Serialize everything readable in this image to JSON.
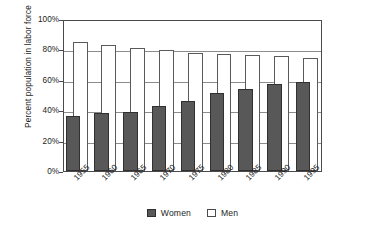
{
  "chart_data": {
    "type": "bar",
    "title": "",
    "subtitle": "",
    "xlabel": "",
    "ylabel": "Percent population in labor force",
    "ylim": [
      0,
      100
    ],
    "yticks": [
      "0%",
      "20%",
      "40%",
      "60%",
      "80%",
      "100%"
    ],
    "ytick_values": [
      0,
      20,
      40,
      60,
      80,
      100
    ],
    "grid": true,
    "legend_position": "bottom-center",
    "bar_style": "overlapped",
    "categories": [
      "1955",
      "1960",
      "1965",
      "1970",
      "1975",
      "1980",
      "1985",
      "1990",
      "1995"
    ],
    "series": [
      {
        "name": "Women",
        "color": "#585858",
        "values": [
          36,
          38,
          39,
          43,
          46,
          51,
          54,
          57,
          58.5
        ]
      },
      {
        "name": "Men",
        "color": "#ffffff",
        "values": [
          85,
          83,
          81,
          79.5,
          77.5,
          77,
          76,
          75.5,
          74.5
        ]
      }
    ]
  },
  "axis": {
    "y_title": "Percent population in labor force"
  },
  "legend": {
    "items": [
      {
        "label": "Women",
        "swatch": "filled-dark-square"
      },
      {
        "label": "Men",
        "swatch": "outlined-white-square"
      }
    ]
  }
}
